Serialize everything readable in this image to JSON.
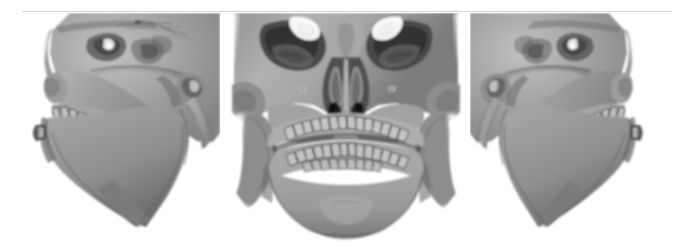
{
  "figure": {
    "title": "",
    "caption": "",
    "background_color": "#ffffff",
    "rule_color": "#d4d4d4",
    "modality": "3D CT volume rendering",
    "panel_count": 3
  },
  "panels": [
    {
      "id": "panel-left",
      "view_label": "",
      "view": "left oblique lateral",
      "content": "3D reconstructed skull, left three-quarter profile showing zygomatic arch, maxilla, mandibular ramus, body and dentition",
      "surface_color": "#9a9a9a",
      "shadow_color": "#4a4a4a",
      "highlight_color": "#d8d8d8"
    },
    {
      "id": "panel-front",
      "view_label": "",
      "view": "anterior frontal",
      "content": "3D reconstructed skull, frontal view showing orbits, nasal aperture with turbinates, maxillary and mandibular teeth, chin",
      "surface_color": "#9a9a9a",
      "shadow_color": "#4a4a4a",
      "highlight_color": "#d8d8d8"
    },
    {
      "id": "panel-right",
      "view_label": "",
      "view": "right oblique lateral",
      "content": "3D reconstructed skull, right three-quarter profile showing zygomatic arch, maxilla, mandibular ramus, body and dentition",
      "surface_color": "#9a9a9a",
      "shadow_color": "#4a4a4a",
      "highlight_color": "#d8d8d8"
    }
  ],
  "colors": {
    "page_background": "#ffffff",
    "bone_mid": "#9a9a9a",
    "bone_light": "#c9c9c9",
    "bone_dark": "#565656",
    "crevice": "#2f2f2f",
    "rule": "#d4d4d4"
  }
}
